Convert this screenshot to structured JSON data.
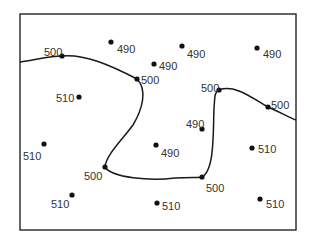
{
  "diagram": {
    "type": "isoline-map",
    "frame": {
      "x": 20,
      "y": 14,
      "width": 276,
      "height": 216
    },
    "isoline": {
      "value": "500",
      "stroke": "#1a1a1a"
    },
    "points": [
      {
        "value": "500",
        "x": 62,
        "y": 56,
        "lx": 44,
        "ly": 52
      },
      {
        "value": "490",
        "x": 111,
        "y": 42,
        "lx": 117,
        "ly": 49
      },
      {
        "value": "500",
        "x": 137,
        "y": 79,
        "lx": 141,
        "ly": 80
      },
      {
        "value": "490",
        "x": 154,
        "y": 64,
        "lx": 159,
        "ly": 66
      },
      {
        "value": "490",
        "x": 182,
        "y": 46,
        "lx": 187,
        "ly": 54
      },
      {
        "value": "490",
        "x": 257,
        "y": 48,
        "lx": 263,
        "ly": 54
      },
      {
        "value": "510",
        "x": 79,
        "y": 97,
        "lx": 56,
        "ly": 98
      },
      {
        "value": "500",
        "x": 219,
        "y": 90,
        "lx": 201,
        "ly": 88
      },
      {
        "value": "500",
        "x": 268,
        "y": 107,
        "lx": 271,
        "ly": 105
      },
      {
        "value": "490",
        "x": 202,
        "y": 129,
        "lx": 186,
        "ly": 124
      },
      {
        "value": "510",
        "x": 44,
        "y": 144,
        "lx": 23,
        "ly": 156
      },
      {
        "value": "490",
        "x": 156,
        "y": 145,
        "lx": 161,
        "ly": 153
      },
      {
        "value": "510",
        "x": 252,
        "y": 148,
        "lx": 258,
        "ly": 149
      },
      {
        "value": "500",
        "x": 105,
        "y": 167,
        "lx": 84,
        "ly": 176
      },
      {
        "value": "500",
        "x": 202,
        "y": 177,
        "lx": 206,
        "ly": 188
      },
      {
        "value": "510",
        "x": 72,
        "y": 195,
        "lx": 51,
        "ly": 204
      },
      {
        "value": "510",
        "x": 157,
        "y": 203,
        "lx": 162,
        "ly": 206
      },
      {
        "value": "510",
        "x": 260,
        "y": 199,
        "lx": 266,
        "ly": 204
      }
    ]
  }
}
